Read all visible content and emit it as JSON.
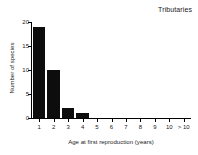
{
  "chart_data": {
    "type": "bar",
    "title": "Tributaries",
    "xlabel": "Age at first reproduction (years)",
    "ylabel": "Number of species",
    "categories": [
      "1",
      "2",
      "3",
      "4",
      "5",
      "6",
      "7",
      "8",
      "9",
      "10",
      "> 10"
    ],
    "values": [
      19,
      10,
      2,
      1,
      0,
      0,
      0,
      0,
      0,
      0,
      0
    ],
    "ylim": [
      0,
      20
    ],
    "yticks": [
      0,
      5,
      10,
      15,
      20
    ],
    "ytick_labels": [
      "0",
      "5",
      "10",
      "15",
      "20"
    ],
    "grid": false,
    "legend": false,
    "bar_color": "#0d0d0d",
    "axis_color": "#000000",
    "background": "#ffffff"
  }
}
